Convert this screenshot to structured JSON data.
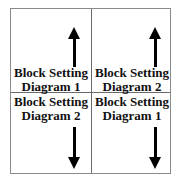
{
  "cells": [
    {
      "label_line1": "Block Setting",
      "label_line2": "Diagram 1",
      "arrow": "up"
    },
    {
      "label_line1": "Block Setting",
      "label_line2": "Diagram 2",
      "arrow": "up"
    },
    {
      "label_line1": "Block Setting",
      "label_line2": "Diagram 2",
      "arrow": "down"
    },
    {
      "label_line1": "Block Setting",
      "label_line2": "Diagram 1",
      "arrow": "down"
    }
  ],
  "colors": {
    "border": "#8a8a8a",
    "divider": "#6a6a6a",
    "arrow": "#000000"
  }
}
